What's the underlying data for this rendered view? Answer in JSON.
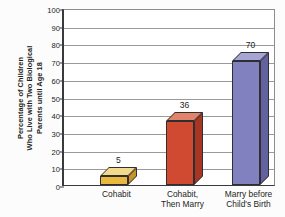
{
  "chart_data": {
    "type": "bar",
    "title": "",
    "subtitle": "",
    "xlabel": "",
    "ylabel": "Percentage of Children Who Live with Two Biological Parents until Age 18",
    "ylabel_lines": [
      "Percentage of Children",
      "Who Live with Two Biological",
      "Parents until Age 18"
    ],
    "categories": [
      "Cohabit",
      "Cohabit, Then Marry",
      "Marry before Child's Birth"
    ],
    "category_label_lines": [
      [
        "Cohabit"
      ],
      [
        "Cohabit,",
        "Then Marry"
      ],
      [
        "Marry before",
        "Child's Birth"
      ]
    ],
    "values": [
      5,
      36,
      70
    ],
    "value_labels": [
      "5",
      "36",
      "70"
    ],
    "ylim": [
      0,
      100
    ],
    "ytick_labels": [
      "100",
      "90",
      "80",
      "70",
      "60",
      "50",
      "40",
      "30",
      "20",
      "10",
      "0"
    ],
    "ytick_values": [
      100,
      90,
      80,
      70,
      60,
      50,
      40,
      30,
      20,
      10,
      0
    ],
    "grid": true,
    "legend": false,
    "style": "3d-column",
    "bar_colors": [
      "#e9b93f",
      "#cf4a31",
      "#8281c0"
    ],
    "bar_top_colors": [
      "#f3d98c",
      "#e2836c",
      "#a6a5d6"
    ],
    "bar_side_colors": [
      "#c9912a",
      "#a93623",
      "#63619f"
    ],
    "axis_color": "#3a3a3c",
    "grid_color": "#9a9a9d",
    "text_color": "#231f20",
    "plot_background": "#ffffff",
    "figure_background": "#fcfcfd"
  }
}
